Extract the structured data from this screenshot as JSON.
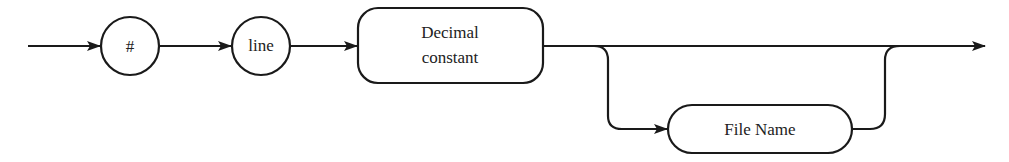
{
  "diagram": {
    "type": "syntax-railroad-diagram",
    "nodes": [
      {
        "id": "hash",
        "shape": "circle",
        "label": "#"
      },
      {
        "id": "line",
        "shape": "circle",
        "label": "line"
      },
      {
        "id": "decimal",
        "shape": "rounded-rect",
        "label_lines": [
          "Decimal",
          "constant"
        ]
      },
      {
        "id": "filename",
        "shape": "pill",
        "label": "File Name",
        "optional": true
      }
    ],
    "edges": [
      {
        "from": "start",
        "to": "hash"
      },
      {
        "from": "hash",
        "to": "line"
      },
      {
        "from": "line",
        "to": "decimal"
      },
      {
        "from": "decimal",
        "to": "end",
        "kind": "bypass"
      },
      {
        "from": "decimal",
        "to": "filename",
        "kind": "branch"
      },
      {
        "from": "filename",
        "to": "end",
        "kind": "merge"
      }
    ],
    "colors": {
      "stroke": "#1a1a1a",
      "background": "#ffffff"
    }
  }
}
